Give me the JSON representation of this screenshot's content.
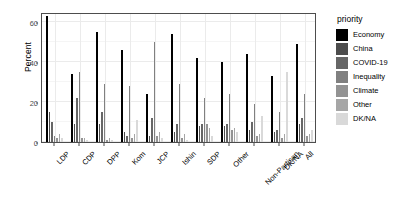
{
  "chart_data": {
    "type": "bar",
    "title": "",
    "xlabel": "",
    "ylabel": "Percent",
    "ylim": [
      0,
      65
    ],
    "yticks": [
      0,
      20,
      40,
      60
    ],
    "grid": true,
    "legend_position": "right",
    "legend_title": "priority",
    "categories": [
      "LDP",
      "CDP",
      "DPP",
      "Kom",
      "JCP",
      "Ishin",
      "SDP",
      "Other",
      "Non-Partisan",
      "DK/NA",
      "All"
    ],
    "series": [
      {
        "name": "Economy",
        "color": "#000000",
        "values": [
          63,
          34,
          55,
          46,
          24,
          54,
          42,
          40,
          44,
          33,
          49
        ]
      },
      {
        "name": "China",
        "color": "#4d4d4d",
        "values": [
          15,
          9,
          9,
          5,
          3,
          5,
          8,
          8,
          6,
          5,
          9
        ]
      },
      {
        "name": "COVID-19",
        "color": "#666666",
        "values": [
          10,
          22,
          15,
          3,
          12,
          9,
          9,
          9,
          10,
          6,
          12
        ]
      },
      {
        "name": "Inequality",
        "color": "#808080",
        "values": [
          3,
          35,
          29,
          28,
          50,
          29,
          22,
          24,
          19,
          15,
          24
        ]
      },
      {
        "name": "Climate",
        "color": "#939393",
        "values": [
          2,
          2,
          1,
          2,
          3,
          2,
          9,
          6,
          3,
          2,
          3
        ]
      },
      {
        "name": "Other",
        "color": "#a6a6a6",
        "values": [
          4,
          2,
          2,
          4,
          5,
          4,
          7,
          7,
          4,
          4,
          4
        ]
      },
      {
        "name": "DK/NA",
        "color": "#d9d9d9",
        "values": [
          2,
          1,
          1,
          11,
          2,
          1,
          3,
          5,
          13,
          35,
          6
        ]
      }
    ]
  }
}
